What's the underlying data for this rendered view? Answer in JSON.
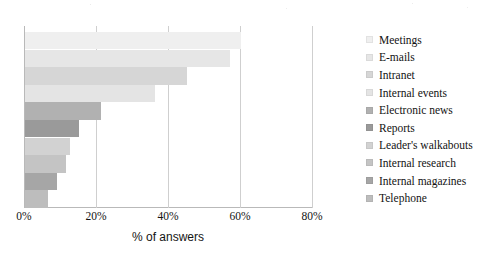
{
  "chart_data": {
    "type": "bar",
    "orientation": "horizontal",
    "title": "",
    "subtitle": "",
    "xlabel": "% of answers",
    "ylabel": "",
    "xlim": [
      0,
      80
    ],
    "xticks": [
      "0%",
      "20%",
      "40%",
      "60%",
      "80%"
    ],
    "xtick_values": [
      0,
      20,
      40,
      60,
      80
    ],
    "grid": "vertical gridlines at each 20% tick",
    "legend_position": "right",
    "categories": [
      "Meetings",
      "E-mails",
      "Intranet",
      "Internal events",
      "Electronic news",
      "Reports",
      "Leader's walkabouts",
      "Internal research",
      "Internal magazines",
      "Telephone"
    ],
    "values": [
      60,
      57,
      45,
      36,
      21,
      15,
      12.5,
      11.5,
      9,
      6.5
    ],
    "bar_colors": [
      "#efefef",
      "#e6e6e6",
      "#d6d6d6",
      "#e4e4e4",
      "#b1b1b1",
      "#9a9a9a",
      "#d2d2d2",
      "#c4c4c4",
      "#a6a6a6",
      "#bdbdbd"
    ],
    "series": [
      {
        "name": "% of answers",
        "values": [
          60,
          57,
          45,
          36,
          21,
          15,
          12.5,
          11.5,
          9,
          6.5
        ]
      }
    ]
  },
  "legend": {
    "items": [
      {
        "label": "Meetings",
        "color": "#efefef"
      },
      {
        "label": "E-mails",
        "color": "#e6e6e6"
      },
      {
        "label": "Intranet",
        "color": "#d6d6d6"
      },
      {
        "label": "Internal events",
        "color": "#e4e4e4"
      },
      {
        "label": "Electronic news",
        "color": "#b1b1b1"
      },
      {
        "label": "Reports",
        "color": "#9a9a9a"
      },
      {
        "label": "Leader's walkabouts",
        "color": "#d2d2d2"
      },
      {
        "label": "Internal research",
        "color": "#c4c4c4"
      },
      {
        "label": "Internal magazines",
        "color": "#a6a6a6"
      },
      {
        "label": "Telephone",
        "color": "#bdbdbd"
      }
    ]
  },
  "axis": {
    "title": "% of answers",
    "ticks": [
      "0%",
      "20%",
      "40%",
      "60%",
      "80%"
    ]
  }
}
